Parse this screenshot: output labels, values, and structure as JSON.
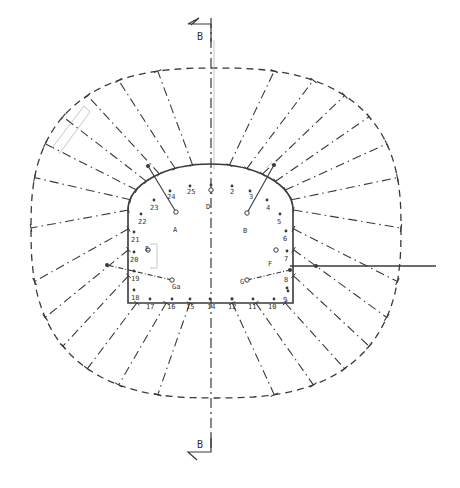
{
  "diagram": {
    "type": "tunnel-cross-section",
    "section_marker": {
      "label": "B",
      "top": {
        "x": 203,
        "y": 30
      },
      "bottom": {
        "x": 203,
        "y": 446
      }
    },
    "colors": {
      "stroke": "#3a3a3a",
      "light": "#b8b8b8",
      "background": "#ffffff"
    },
    "axis": {
      "x": 211,
      "y1": 18,
      "y2": 452
    },
    "inner_profile": {
      "left_x": 128,
      "right_x": 293,
      "bottom_y": 303,
      "wall_top_y": 210,
      "crown_y": 172,
      "center_x": 211
    },
    "outer_boundary": {
      "cx": 216,
      "cy": 228,
      "rx": 185,
      "ry_top": 160,
      "ry_bottom": 170
    },
    "perimeter_points": [
      {
        "id": "1",
        "x": 211,
        "y": 185
      },
      {
        "id": "2",
        "x": 232,
        "y": 186
      },
      {
        "id": "3",
        "x": 250,
        "y": 191
      },
      {
        "id": "4",
        "x": 267,
        "y": 200
      },
      {
        "id": "5",
        "x": 280,
        "y": 214
      },
      {
        "id": "6",
        "x": 286,
        "y": 231
      },
      {
        "id": "7",
        "x": 287,
        "y": 251
      },
      {
        "id": "8",
        "x": 288,
        "y": 291
      },
      {
        "id": "9",
        "x": 287,
        "y": 288
      },
      {
        "id": "10",
        "x": 274,
        "y": 299
      },
      {
        "id": "11",
        "x": 253,
        "y": 299
      },
      {
        "id": "12",
        "x": 232,
        "y": 299
      },
      {
        "id": "13",
        "x": 232,
        "y": 299
      },
      {
        "id": "14",
        "x": 210,
        "y": 299
      },
      {
        "id": "15",
        "x": 190,
        "y": 299
      },
      {
        "id": "16",
        "x": 172,
        "y": 299
      },
      {
        "id": "17",
        "x": 150,
        "y": 299
      },
      {
        "id": "18",
        "x": 134,
        "y": 290
      },
      {
        "id": "19",
        "x": 134,
        "y": 271
      },
      {
        "id": "20",
        "x": 134,
        "y": 252
      },
      {
        "id": "21",
        "x": 134,
        "y": 232
      },
      {
        "id": "22",
        "x": 141,
        "y": 214
      },
      {
        "id": "23",
        "x": 154,
        "y": 200
      },
      {
        "id": "24",
        "x": 170,
        "y": 191
      },
      {
        "id": "25",
        "x": 190,
        "y": 186
      }
    ],
    "labels": [
      {
        "text": "1",
        "x": 209,
        "y": 186
      },
      {
        "text": "2",
        "x": 230,
        "y": 186
      },
      {
        "text": "3",
        "x": 249,
        "y": 191
      },
      {
        "text": "4",
        "x": 266,
        "y": 202
      },
      {
        "text": "5",
        "x": 277,
        "y": 216
      },
      {
        "text": "6",
        "x": 283,
        "y": 233
      },
      {
        "text": "7",
        "x": 284,
        "y": 253
      },
      {
        "text": "8",
        "x": 284,
        "y": 274
      },
      {
        "text": "9",
        "x": 283,
        "y": 294
      },
      {
        "text": "10",
        "x": 268,
        "y": 301
      },
      {
        "text": "11",
        "x": 248,
        "y": 301
      },
      {
        "text": "12",
        "x": 228,
        "y": 301
      },
      {
        "text": "14",
        "x": 207,
        "y": 301
      },
      {
        "text": "15",
        "x": 186,
        "y": 301
      },
      {
        "text": "16",
        "x": 167,
        "y": 301
      },
      {
        "text": "17",
        "x": 146,
        "y": 301
      },
      {
        "text": "18",
        "x": 131,
        "y": 292
      },
      {
        "text": "19",
        "x": 131,
        "y": 273
      },
      {
        "text": "20",
        "x": 130,
        "y": 254
      },
      {
        "text": "21",
        "x": 131,
        "y": 234
      },
      {
        "text": "22",
        "x": 138,
        "y": 216
      },
      {
        "text": "23",
        "x": 150,
        "y": 202
      },
      {
        "text": "24",
        "x": 167,
        "y": 191
      },
      {
        "text": "25",
        "x": 187,
        "y": 186
      }
    ],
    "instruments": [
      {
        "id": "A",
        "x": 176,
        "y": 212,
        "line_to": {
          "x": 148,
          "y": 166
        },
        "label_x": 173,
        "label_y": 226
      },
      {
        "id": "B",
        "x": 247,
        "y": 213,
        "line_to": {
          "x": 274,
          "y": 165
        },
        "label_x": 243,
        "label_y": 227
      },
      {
        "id": "D",
        "x": 211,
        "y": 190,
        "label_x": 206,
        "label_y": 203
      },
      {
        "id": "E",
        "x": 148,
        "y": 250,
        "label_x": 145,
        "label_y": 245
      },
      {
        "id": "F",
        "x": 276,
        "y": 250,
        "label_x": 268,
        "label_y": 260
      },
      {
        "id": "Ga",
        "x": 172,
        "y": 280,
        "line_to": {
          "x": 107,
          "y": 265
        },
        "label_x": 172,
        "label_y": 283
      },
      {
        "id": "Gb",
        "x": 247,
        "y": 280,
        "line_to": {
          "x": 290,
          "y": 270
        },
        "label_x": 240,
        "label_y": 278
      }
    ],
    "extension_line": {
      "x1": 290,
      "y1": 266,
      "x2": 436,
      "y2": 266
    }
  }
}
